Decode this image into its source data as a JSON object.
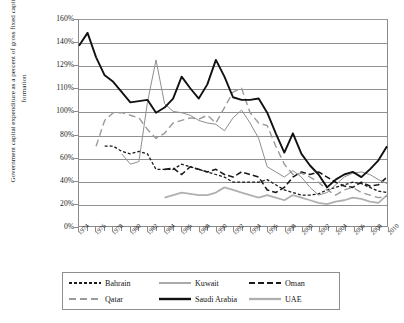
{
  "axis": {
    "y_title": "Government capital expenditure as a percent of gross fixed capital formation",
    "y_ticks": [
      "160%",
      "140%",
      "129%",
      "110%",
      "100%",
      "80%",
      "60%",
      "40%",
      "20%",
      "0%"
    ],
    "x_ticks": [
      "1974",
      "1976",
      "1978",
      "1980",
      "1982",
      "1984",
      "1986",
      "1988",
      "1990",
      "1992",
      "1994",
      "1996",
      "1998",
      "2000",
      "2002",
      "2004",
      "2006",
      "2008",
      "2010"
    ]
  },
  "legend": {
    "items": [
      {
        "label": "Bahrain",
        "key": "bahrain"
      },
      {
        "label": "Kuwait",
        "key": "kuwait"
      },
      {
        "label": "Oman",
        "key": "oman"
      },
      {
        "label": "Qatar",
        "key": "qatar"
      },
      {
        "label": "Saudi Arabia",
        "key": "saudi_arabia"
      },
      {
        "label": "UAE",
        "key": "uae"
      }
    ]
  },
  "colors": {
    "bahrain": "#1a1a1a",
    "kuwait": "#8d8d8d",
    "oman": "#1a1a1a",
    "qatar": "#9a9a9a",
    "saudi_arabia": "#111111",
    "uae": "#b0b0b0",
    "gridline": "#919191",
    "frame": "#8a8a8a",
    "text": "#1b1b1b"
  },
  "chart_data": {
    "type": "line",
    "title": "",
    "xlabel": "",
    "ylabel": "Government capital expenditure as a percent of gross fixed capital formation",
    "xlim": [
      1974,
      2010
    ],
    "ylim": [
      0,
      160
    ],
    "grid": true,
    "legend_position": "bottom",
    "ytick_values": [
      160,
      140,
      129,
      110,
      100,
      80,
      60,
      40,
      20,
      0
    ],
    "ytick_labels": [
      "160%",
      "140%",
      "129%",
      "110%",
      "100%",
      "80%",
      "60%",
      "40%",
      "20%",
      "0%"
    ],
    "x": [
      1974,
      1975,
      1976,
      1977,
      1978,
      1979,
      1980,
      1981,
      1982,
      1983,
      1984,
      1985,
      1986,
      1987,
      1988,
      1989,
      1990,
      1991,
      1992,
      1993,
      1994,
      1995,
      1996,
      1997,
      1998,
      1999,
      2000,
      2001,
      2002,
      2003,
      2004,
      2005,
      2006,
      2007,
      2008,
      2009,
      2010
    ],
    "series": [
      {
        "name": "Saudi Arabia",
        "key": "saudi_arabia",
        "style": "solid",
        "width": 1.9,
        "color": "#111111",
        "values": [
          140,
          150,
          131,
          117,
          112,
          104,
          96,
          97,
          98,
          88,
          92,
          99,
          116,
          107,
          99,
          110,
          129,
          116,
          100,
          98,
          98,
          99,
          88,
          72,
          57,
          72,
          56,
          47,
          40,
          30,
          36,
          40,
          42,
          38,
          44,
          51,
          62
        ]
      },
      {
        "name": "Kuwait",
        "key": "kuwait",
        "style": "solid",
        "width": 1.0,
        "color": "#8d8d8d",
        "values": [
          null,
          null,
          null,
          null,
          null,
          56,
          48,
          50,
          96,
          129,
          95,
          89,
          88,
          86,
          82,
          80,
          79,
          74,
          84,
          90,
          80,
          68,
          46,
          42,
          38,
          43,
          38,
          30,
          24,
          26,
          32,
          38,
          41,
          42,
          40,
          36,
          33
        ]
      },
      {
        "name": "Qatar",
        "key": "qatar",
        "style": "dash-long",
        "width": 1.4,
        "color": "#9a9a9a",
        "values": [
          null,
          null,
          62,
          82,
          88,
          88,
          86,
          84,
          75,
          68,
          72,
          80,
          82,
          84,
          83,
          86,
          80,
          92,
          104,
          107,
          88,
          80,
          78,
          62,
          48,
          40,
          41,
          38,
          34,
          28,
          24,
          28,
          30,
          26,
          24,
          22,
          23
        ]
      },
      {
        "name": "Bahrain",
        "key": "bahrain",
        "style": "dash-short",
        "width": 1.3,
        "color": "#1a1a1a",
        "values": [
          null,
          null,
          null,
          62,
          62,
          58,
          56,
          58,
          56,
          44,
          44,
          44,
          48,
          46,
          44,
          42,
          40,
          38,
          34,
          34,
          34,
          34,
          36,
          32,
          28,
          26,
          24,
          24,
          25,
          28,
          30,
          32,
          34,
          33,
          30,
          27,
          26
        ]
      },
      {
        "name": "Oman",
        "key": "oman",
        "style": "dash-med",
        "width": 1.6,
        "color": "#1a1a1a",
        "values": [
          null,
          null,
          null,
          null,
          null,
          null,
          null,
          null,
          null,
          null,
          44,
          45,
          40,
          46,
          44,
          42,
          44,
          40,
          38,
          42,
          40,
          38,
          28,
          26,
          30,
          38,
          42,
          40,
          42,
          38,
          34,
          31,
          30,
          34,
          31,
          32,
          38
        ]
      },
      {
        "name": "UAE",
        "key": "uae",
        "style": "solid",
        "width": 1.8,
        "color": "#b0b0b0",
        "values": [
          null,
          null,
          null,
          null,
          null,
          null,
          null,
          null,
          null,
          null,
          22,
          24,
          26,
          25,
          24,
          24,
          26,
          30,
          28,
          26,
          24,
          22,
          24,
          22,
          20,
          24,
          22,
          20,
          18,
          17,
          19,
          20,
          22,
          21,
          19,
          18,
          24
        ]
      }
    ]
  }
}
